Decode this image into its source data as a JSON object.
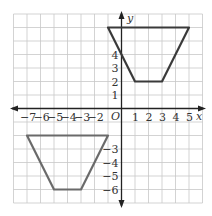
{
  "diagram": {
    "type": "coordinate-plane",
    "x_range": [
      -8,
      6
    ],
    "y_range": [
      -7,
      7
    ],
    "origin_label": "O",
    "x_axis_label": "x",
    "y_axis_label": "y",
    "x_tick_labels": [
      "-7",
      "-6",
      "-5",
      "-4",
      "-3",
      "-2",
      "1",
      "2",
      "3",
      "4",
      "5"
    ],
    "y_tick_labels": [
      "4",
      "3",
      "2",
      "1",
      "-3",
      "-4",
      "-5",
      "-6"
    ],
    "colors": {
      "grid": "#c8c8c8",
      "axis": "#222222",
      "shape_top": "#3a3a3a",
      "shape_bottom": "#6a6a6a"
    },
    "shapes": [
      {
        "name": "trapezoid-top",
        "vertices": [
          [
            -1,
            6
          ],
          [
            5,
            6
          ],
          [
            3,
            2
          ],
          [
            1,
            2
          ]
        ]
      },
      {
        "name": "trapezoid-bottom",
        "vertices": [
          [
            -7,
            -2
          ],
          [
            -1,
            -2
          ],
          [
            -3,
            -6
          ],
          [
            -5,
            -6
          ]
        ]
      }
    ]
  }
}
